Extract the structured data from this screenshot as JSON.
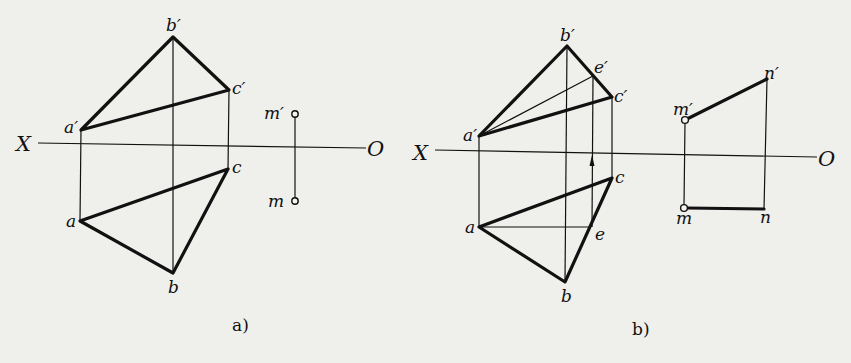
{
  "figure_a": {
    "caption": "a)",
    "axis": {
      "left_label": "X",
      "right_label": "O"
    },
    "points": {
      "a_prime": "a′",
      "b_prime": "b′",
      "c_prime": "c′",
      "a": "a",
      "b": "b",
      "c": "c",
      "m_prime": "m′",
      "m": "m"
    }
  },
  "figure_b": {
    "caption": "b)",
    "axis": {
      "left_label": "X",
      "right_label": "O"
    },
    "points": {
      "a_prime": "a′",
      "b_prime": "b′",
      "c_prime": "c′",
      "e_prime": "e′",
      "a": "a",
      "b": "b",
      "c": "c",
      "e": "e",
      "m_prime": "m′",
      "n_prime": "n′",
      "m": "m",
      "n": "n"
    }
  },
  "colors": {
    "ink": "#111111",
    "paper": "#efefec"
  }
}
